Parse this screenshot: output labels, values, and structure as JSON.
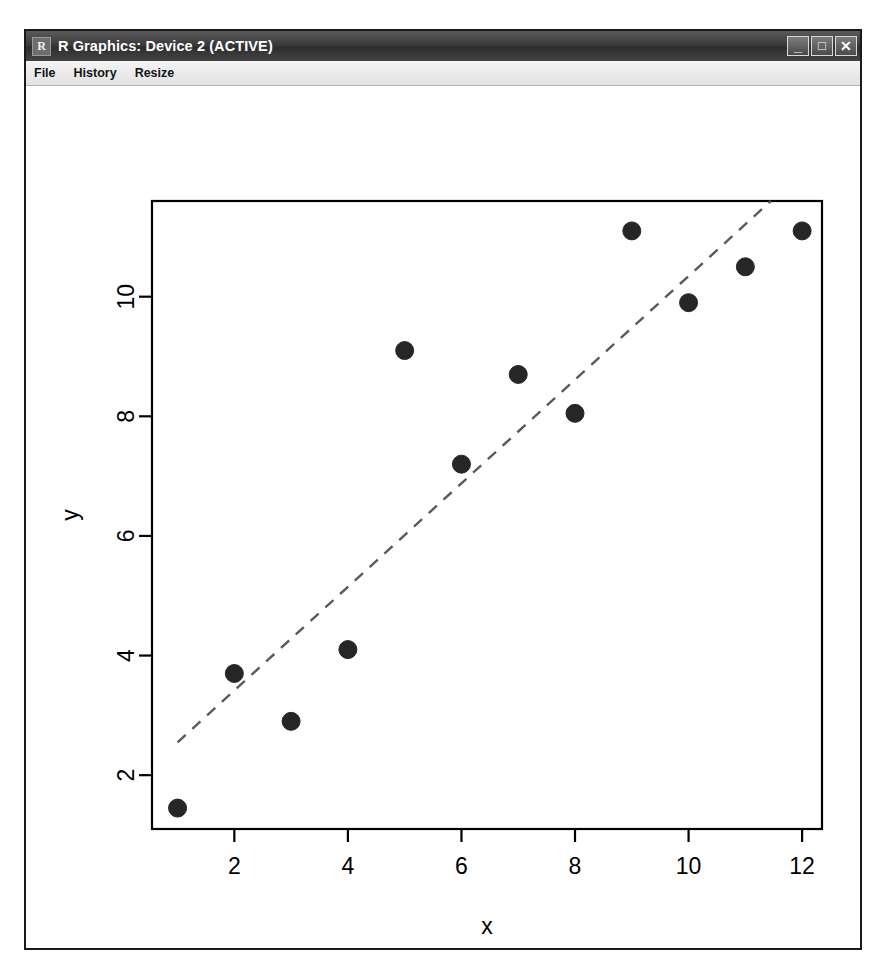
{
  "window": {
    "title": "R Graphics: Device 2 (ACTIVE)",
    "icon": "R",
    "icon_name": "r-logo-icon",
    "controls": {
      "minimize": "_",
      "maximize": "□",
      "close": "✕"
    }
  },
  "menu": {
    "items": [
      {
        "label": "File"
      },
      {
        "label": "History"
      },
      {
        "label": "Resize"
      }
    ]
  },
  "chart_data": {
    "type": "scatter",
    "title": "",
    "xlabel": "x",
    "ylabel": "y",
    "xlim": [
      0.55,
      12.35
    ],
    "ylim": [
      1.1,
      11.6
    ],
    "xticks": [
      2,
      4,
      6,
      8,
      10,
      12
    ],
    "yticks": [
      2,
      4,
      6,
      8,
      10
    ],
    "grid": false,
    "legend": "none",
    "box": true,
    "point_style": {
      "marker": "filled-circle",
      "color": "#262626",
      "size": 9
    },
    "x": [
      1,
      2,
      3,
      4,
      5,
      6,
      7,
      8,
      9,
      10,
      11,
      12
    ],
    "y": [
      1.45,
      3.7,
      2.9,
      4.1,
      9.1,
      7.2,
      8.7,
      8.05,
      11.1,
      9.9,
      10.5,
      11.1
    ],
    "series": [
      {
        "name": "observations",
        "values": [
          1.45,
          3.7,
          2.9,
          4.1,
          9.1,
          7.2,
          8.7,
          8.05,
          11.1,
          9.9,
          10.5,
          11.1
        ]
      }
    ],
    "trendline": {
      "type": "linear-fit",
      "style": "dashed",
      "color": "#5a5a5a",
      "x_start": 1.0,
      "y_start": 2.55,
      "x_end": 11.45,
      "y_end": 11.6
    }
  }
}
